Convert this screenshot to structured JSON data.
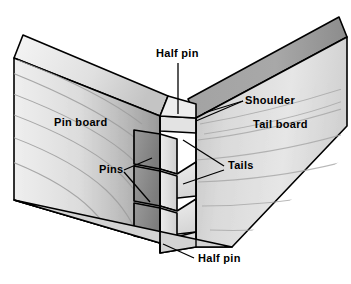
{
  "diagram": {
    "background_color": "#ffffff",
    "line_color": "#000000",
    "labels": [
      {
        "id": "half-pin-top",
        "text": "Half pin",
        "x": 156,
        "y": 57
      },
      {
        "id": "shoulder",
        "text": "Shoulder",
        "x": 245,
        "y": 104
      },
      {
        "id": "pin-board",
        "text": "Pin board",
        "x": 54,
        "y": 126
      },
      {
        "id": "tail-board",
        "text": "Tail board",
        "x": 253,
        "y": 128
      },
      {
        "id": "pins",
        "text": "Pins",
        "x": 99,
        "y": 173
      },
      {
        "id": "tails",
        "text": "Tails",
        "x": 228,
        "y": 169
      },
      {
        "id": "half-pin-bottom",
        "text": "Half pin",
        "x": 198,
        "y": 262
      }
    ],
    "parts": {
      "pin_board_label": "Pin board",
      "tail_board_label": "Tail board",
      "pins_label": "Pins",
      "tails_label": "Tails",
      "shoulder_label": "Shoulder",
      "half_pin_label": "Half pin"
    },
    "colors": {
      "pin_board_face_light": "#e8e8e8",
      "pin_board_face_dark": "#9a9a9a",
      "pin_board_top_light": "#f2f2f2",
      "pin_board_top_dark": "#c9c9c9",
      "tail_board_face_light": "#e4e4e4",
      "tail_board_face_dark": "#bdbdbd",
      "tail_board_top_light": "#b4b4b4",
      "tail_board_top_dark": "#8e8e8e",
      "pin_end_grain": "#8c8c8c",
      "pin_end_grain_dark": "#7a7a7a",
      "grain_line": "#9d9d9d",
      "outline": "#000000",
      "text": "#000000"
    },
    "counts": {
      "pins_visible": 3,
      "tails_visible": 3,
      "half_pins": 2
    }
  }
}
